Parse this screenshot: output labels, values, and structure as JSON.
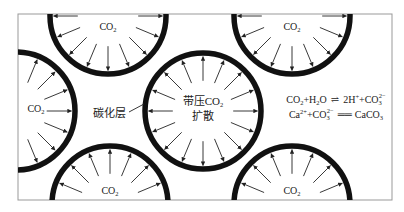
{
  "diagram": {
    "title": "",
    "frame": {
      "x": 18,
      "y": 14,
      "w": 374,
      "h": 186
    },
    "colors": {
      "rim": "#111111",
      "arrow": "#222222",
      "frame": "#999999",
      "background": "#ffffff"
    },
    "circles": [
      {
        "id": "top-left-pore",
        "cx": 108,
        "cy": 16,
        "r": 58,
        "label": "CO",
        "sub": "2",
        "label_x": 108,
        "label_y": 30
      },
      {
        "id": "top-right-pore",
        "cx": 292,
        "cy": 16,
        "r": 58,
        "label": "CO",
        "sub": "2",
        "label_x": 292,
        "label_y": 30
      },
      {
        "id": "left-pore",
        "cx": 16,
        "cy": 111,
        "r": 59,
        "label": "CO",
        "sub": "2",
        "label_x": 36,
        "label_y": 112
      },
      {
        "id": "center-pore",
        "cx": 203,
        "cy": 111,
        "r": 58,
        "label": "",
        "sub": "",
        "label_x": 203,
        "label_y": 111
      },
      {
        "id": "bottom-left-pore",
        "cx": 110,
        "cy": 204,
        "r": 58,
        "label": "CO",
        "sub": "2",
        "label_x": 110,
        "label_y": 194
      },
      {
        "id": "bottom-right-pore",
        "cx": 292,
        "cy": 204,
        "r": 58,
        "label": "CO",
        "sub": "2",
        "label_x": 292,
        "label_y": 194
      }
    ],
    "center_label": {
      "line1_prefix": "带压CO",
      "line1_sub": "2",
      "line2": "扩散"
    },
    "carbonation_layer_label": "碳化层",
    "equations": {
      "eq1": {
        "lhs": "CO",
        "lhs_sub": "2",
        "plus_h2o": "+H",
        "h2o_sub": "2",
        "o": "O",
        "arrow": "⇌",
        "rhs1": "2H",
        "rhs1_sup": "+",
        "rhs2": "+CO",
        "rhs2_sub": "3",
        "rhs2_sup": "2−"
      },
      "eq2": {
        "ca": "Ca",
        "ca_sup": "2+",
        "plus_co3": "+CO",
        "co3_sub": "3",
        "co3_sup": "2−",
        "arrow": "══",
        "product": "CaCO",
        "product_sub": "3"
      }
    },
    "arrow_direction": "from pore interior toward rim (outward)"
  }
}
